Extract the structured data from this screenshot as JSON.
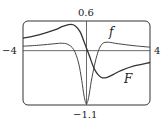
{
  "chart_data": {
    "type": "line",
    "title": "",
    "xlabel": "",
    "ylabel": "",
    "xlim": [
      -4,
      4
    ],
    "ylim": [
      -1.1,
      0.6
    ],
    "grid": false,
    "legend": "inline labels",
    "tick_labels": {
      "x_left": "−4",
      "x_right": "4",
      "y_top": "0.6",
      "y_bottom": "−1.1"
    },
    "series": [
      {
        "name": "f",
        "label": "f",
        "x": [
          -4,
          -3,
          -2,
          -1.6,
          -1.2,
          -0.8,
          -0.5,
          -0.3,
          -0.15,
          0,
          0.15,
          0.3,
          0.5,
          0.7,
          0.9,
          1.1,
          1.4,
          2,
          3,
          4
        ],
        "y": [
          0.09,
          0.11,
          0.14,
          0.15,
          0.13,
          0.02,
          -0.25,
          -0.6,
          -0.92,
          -1.08,
          -0.92,
          -0.62,
          -0.3,
          -0.05,
          0.1,
          0.16,
          0.17,
          0.14,
          0.1,
          0.07
        ]
      },
      {
        "name": "F",
        "label": "F",
        "x": [
          -4,
          -3,
          -2,
          -1.5,
          -1,
          -0.7,
          -0.4,
          -0.2,
          0,
          0.2,
          0.4,
          0.6,
          0.8,
          1,
          1.3,
          1.7,
          2.2,
          3,
          4
        ],
        "y": [
          0.25,
          0.32,
          0.42,
          0.49,
          0.53,
          0.5,
          0.38,
          0.22,
          0.05,
          -0.12,
          -0.3,
          -0.43,
          -0.51,
          -0.55,
          -0.54,
          -0.48,
          -0.4,
          -0.31,
          -0.24
        ]
      }
    ],
    "annotations": [
      {
        "text": "f",
        "x": 1.1,
        "y": 0.38
      },
      {
        "text": "F",
        "x": 2.0,
        "y": -0.62
      }
    ]
  },
  "labels": {
    "x_left": "−4",
    "x_right": "4",
    "y_top": "0.6",
    "y_bottom": "−1.1",
    "curve_f": "f",
    "curve_F": "F"
  },
  "colors": {
    "frame": "#333333",
    "axes": "#444444",
    "curve_f": "#444444",
    "curve_F": "#333333"
  }
}
